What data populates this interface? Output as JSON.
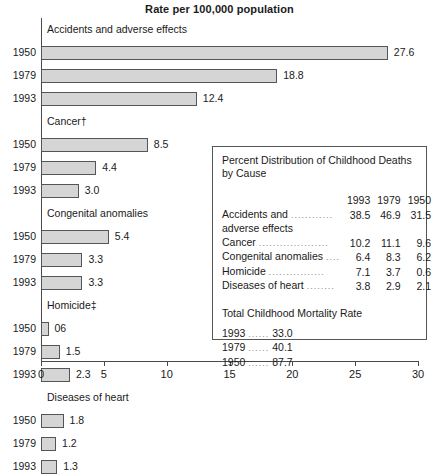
{
  "chart_data": {
    "type": "bar",
    "title": "Rate per 100,000 population",
    "xlabel": "",
    "ylabel": "",
    "xlim": [
      0,
      30
    ],
    "xticks": [
      0,
      5,
      10,
      15,
      20,
      25,
      30
    ],
    "grid": false,
    "orientation": "horizontal",
    "groups": [
      {
        "label": "Accidents and adverse effects",
        "categories": [
          "1950",
          "1979",
          "1993"
        ],
        "values": [
          27.6,
          18.8,
          12.4
        ],
        "value_labels": [
          "27.6",
          "18.8",
          "12.4"
        ]
      },
      {
        "label": "Cancer†",
        "categories": [
          "1950",
          "1979",
          "1993"
        ],
        "values": [
          8.5,
          4.4,
          3.0
        ],
        "value_labels": [
          "8.5",
          "4.4",
          "3.0"
        ]
      },
      {
        "label": "Congenital anomalies",
        "categories": [
          "1950",
          "1979",
          "1993"
        ],
        "values": [
          5.4,
          3.3,
          3.3
        ],
        "value_labels": [
          "5.4",
          "3.3",
          "3.3"
        ]
      },
      {
        "label": "Homicide‡",
        "categories": [
          "1950",
          "1979",
          "1993"
        ],
        "values": [
          0.6,
          1.5,
          2.3
        ],
        "value_labels": [
          "06",
          "1.5",
          "2.3"
        ]
      },
      {
        "label": "Diseases of heart",
        "categories": [
          "1950",
          "1979",
          "1993"
        ],
        "values": [
          1.8,
          1.2,
          1.3
        ],
        "value_labels": [
          "1.8",
          "1.2",
          "1.3"
        ]
      }
    ]
  },
  "inset": {
    "title": "Percent Distribution of Childhood Deaths\nby Cause",
    "column_headers": [
      "1993",
      "1979",
      "1950"
    ],
    "rows": [
      {
        "name": "Accidents and",
        "name2": "adverse effects",
        "leader": "............",
        "values": [
          "38.5",
          "46.9",
          "31.5"
        ]
      },
      {
        "name": "Cancer",
        "leader": "....................",
        "values": [
          "10.2",
          "11.1",
          "9.6"
        ]
      },
      {
        "name": "Congenital anomalies",
        "leader": "....",
        "values": [
          "6.4",
          "8.3",
          "6.2"
        ]
      },
      {
        "name": "Homicide",
        "leader": "................",
        "values": [
          "7.1",
          "3.7",
          "0.6"
        ]
      },
      {
        "name": "Diseases of heart",
        "leader": "........",
        "values": [
          "3.8",
          "2.9",
          "2.1"
        ]
      }
    ],
    "total_title": "Total Childhood Mortality Rate",
    "totals": [
      {
        "year": "1993",
        "leader": "......",
        "value": "33.0"
      },
      {
        "year": "1979",
        "leader": "......",
        "value": "40.1"
      },
      {
        "year": "1950",
        "leader": "......",
        "value": "87.7"
      }
    ]
  },
  "colors": {
    "bar_fill": "#d5d5d5",
    "bar_stroke": "#555555",
    "axis": "#4a4a4a",
    "text": "#1a1a1a"
  }
}
